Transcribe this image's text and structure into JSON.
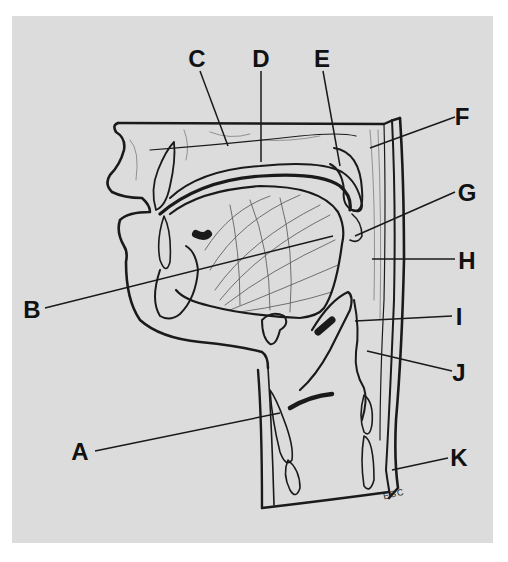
{
  "figure": {
    "background": "#dcdcdc",
    "ink": "#1a1a1a",
    "signature": "ESC"
  },
  "labels": [
    {
      "letter": "A",
      "x": 80,
      "y": 452,
      "pointer": [
        [
          95,
          451
        ],
        [
          280,
          413
        ]
      ]
    },
    {
      "letter": "B",
      "x": 32,
      "y": 310,
      "pointer": [
        [
          45,
          308
        ],
        [
          333,
          236
        ]
      ]
    },
    {
      "letter": "C",
      "x": 197,
      "y": 59,
      "pointer": [
        [
          200,
          71
        ],
        [
          228,
          146
        ]
      ]
    },
    {
      "letter": "D",
      "x": 261,
      "y": 59,
      "pointer": [
        [
          261,
          71
        ],
        [
          261,
          162
        ]
      ]
    },
    {
      "letter": "E",
      "x": 322,
      "y": 59,
      "pointer": [
        [
          323,
          71
        ],
        [
          340,
          166
        ]
      ]
    },
    {
      "letter": "F",
      "x": 462,
      "y": 117,
      "pointer": [
        [
          455,
          117
        ],
        [
          370,
          148
        ]
      ]
    },
    {
      "letter": "G",
      "x": 467,
      "y": 193,
      "pointer": [
        [
          455,
          192
        ],
        [
          355,
          236
        ]
      ]
    },
    {
      "letter": "H",
      "x": 467,
      "y": 261,
      "pointer": [
        [
          455,
          259
        ],
        [
          372,
          259
        ]
      ]
    },
    {
      "letter": "I",
      "x": 459,
      "y": 317,
      "pointer": [
        [
          452,
          316
        ],
        [
          355,
          321
        ]
      ]
    },
    {
      "letter": "J",
      "x": 459,
      "y": 373,
      "pointer": [
        [
          452,
          371
        ],
        [
          367,
          351
        ]
      ]
    },
    {
      "letter": "K",
      "x": 459,
      "y": 458,
      "pointer": [
        [
          448,
          458
        ],
        [
          392,
          470
        ]
      ]
    }
  ]
}
